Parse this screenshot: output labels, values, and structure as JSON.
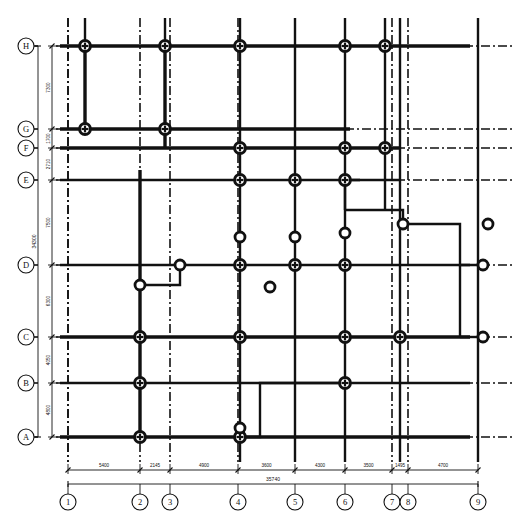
{
  "drawing": {
    "type": "structural-foundation-column-layout-plan",
    "title": "",
    "units": "mm",
    "line_color": "#111111",
    "background_color": "#ffffff"
  },
  "grid": {
    "vertical_axis_labels": [
      "1",
      "2",
      "3",
      "4",
      "5",
      "6",
      "7",
      "8",
      "9"
    ],
    "vertical_axis_x": [
      68,
      140,
      170,
      238,
      295,
      345,
      392,
      408,
      478
    ],
    "horizontal_axis_labels": [
      "H",
      "G",
      "F",
      "E",
      "D",
      "C",
      "B",
      "A"
    ],
    "horizontal_axis_y": [
      46,
      129,
      148,
      180,
      265,
      337,
      383,
      437
    ],
    "horizontal_axis_labels_bottom_up": [
      "A",
      "B",
      "C",
      "D",
      "E",
      "F",
      "G",
      "H"
    ]
  },
  "dimensions": {
    "bottom_chain": [
      {
        "label": "5400",
        "from": "1",
        "to": "2"
      },
      {
        "label": "2145",
        "from": "2",
        "to": "3"
      },
      {
        "label": "4900",
        "from": "3",
        "to": "4"
      },
      {
        "label": "3600",
        "from": "4",
        "to": "5"
      },
      {
        "label": "4300",
        "from": "5",
        "to": "6"
      },
      {
        "label": "3500",
        "from": "6",
        "to": "7"
      },
      {
        "label": "1495",
        "from": "7",
        "to": "8"
      },
      {
        "label": "4700",
        "from": "8",
        "to": "9"
      }
    ],
    "bottom_total": {
      "label": "35740",
      "from": "1",
      "to": "9"
    },
    "left_chain": [
      {
        "label": "7300",
        "from": "H",
        "to": "G"
      },
      {
        "label": "1700",
        "from": "G",
        "to": "F"
      },
      {
        "label": "2710",
        "from": "F",
        "to": "E"
      },
      {
        "label": "7500",
        "from": "E",
        "to": "D"
      },
      {
        "label": "6300",
        "from": "D",
        "to": "C"
      },
      {
        "label": "4050",
        "from": "C",
        "to": "B"
      },
      {
        "label": "4800",
        "from": "B",
        "to": "A"
      }
    ],
    "left_total": {
      "label": "34300",
      "from": "A",
      "to": "H"
    }
  },
  "columns": {
    "legend": {
      "grid_column": "crossed-circle-column-marker",
      "offgrid_column": "plain-circle-column-marker"
    },
    "crossed": [
      {
        "x": 85,
        "y": 46
      },
      {
        "x": 165,
        "y": 46
      },
      {
        "x": 240,
        "y": 46
      },
      {
        "x": 345,
        "y": 46
      },
      {
        "x": 385,
        "y": 46
      },
      {
        "x": 85,
        "y": 129
      },
      {
        "x": 165,
        "y": 129
      },
      {
        "x": 240,
        "y": 148
      },
      {
        "x": 345,
        "y": 148
      },
      {
        "x": 385,
        "y": 148
      },
      {
        "x": 240,
        "y": 180
      },
      {
        "x": 295,
        "y": 180
      },
      {
        "x": 345,
        "y": 180
      },
      {
        "x": 240,
        "y": 265
      },
      {
        "x": 295,
        "y": 265
      },
      {
        "x": 345,
        "y": 265
      },
      {
        "x": 140,
        "y": 337
      },
      {
        "x": 240,
        "y": 337
      },
      {
        "x": 345,
        "y": 337
      },
      {
        "x": 400,
        "y": 337
      },
      {
        "x": 140,
        "y": 383
      },
      {
        "x": 345,
        "y": 383
      },
      {
        "x": 140,
        "y": 437
      },
      {
        "x": 240,
        "y": 437
      }
    ],
    "plain": [
      {
        "x": 240,
        "y": 237
      },
      {
        "x": 295,
        "y": 237
      },
      {
        "x": 345,
        "y": 233
      },
      {
        "x": 180,
        "y": 265
      },
      {
        "x": 483,
        "y": 265
      },
      {
        "x": 140,
        "y": 285
      },
      {
        "x": 270,
        "y": 287
      },
      {
        "x": 403,
        "y": 224
      },
      {
        "x": 488,
        "y": 224
      },
      {
        "x": 483,
        "y": 337
      },
      {
        "x": 240,
        "y": 428
      }
    ]
  },
  "outline": {
    "description": "heavy structural wall / pile-cap outline with stepped edges at right side and bottom",
    "stroke_width_heavy": 3.2,
    "stroke_width_medium": 2.0
  },
  "axis_bubbles": {
    "radius": 8,
    "stroke": "#111111",
    "fill": "#ffffff"
  }
}
